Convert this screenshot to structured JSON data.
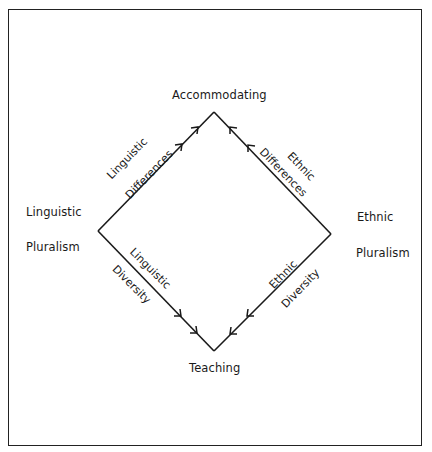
{
  "diagram": {
    "nodes": {
      "top": "Accommodating",
      "bottom": "Teaching",
      "left": [
        "Linguistic",
        "Pluralism"
      ],
      "right": [
        "Ethnic",
        "Pluralism"
      ]
    },
    "edges": {
      "upper_left": [
        "Linguistic",
        "Differences"
      ],
      "upper_right": [
        "Ethnic",
        "Differences"
      ],
      "lower_left": [
        "Linguistic",
        "Diversity"
      ],
      "lower_right": [
        "Ethnic",
        "Diversity"
      ]
    },
    "arrow_directions": {
      "upper_left": "toward Accommodating",
      "upper_right": "toward Accommodating",
      "lower_left": "toward Teaching",
      "lower_right": "toward Teaching"
    },
    "line_color": "#1a1a1a"
  }
}
